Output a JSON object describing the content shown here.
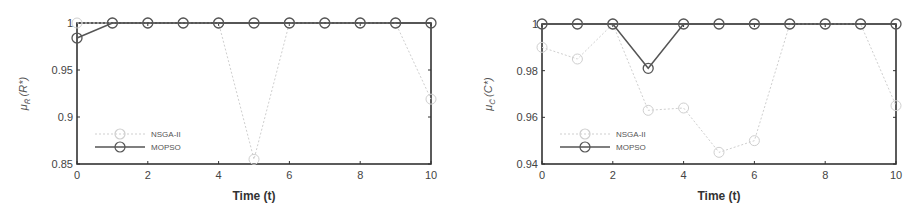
{
  "chart_data": [
    {
      "type": "line",
      "title": "",
      "xlabel": "Time (t)",
      "ylabel": "μ_R̃(R*)",
      "x": [
        0,
        1,
        2,
        3,
        4,
        5,
        6,
        7,
        8,
        9,
        10
      ],
      "xticks": [
        "0",
        "2",
        "4",
        "6",
        "8",
        "10"
      ],
      "yticks": [
        "0.85",
        "0.9",
        "0.95",
        "1"
      ],
      "xlim": [
        0,
        10
      ],
      "ylim": [
        0.85,
        1
      ],
      "grid": false,
      "legend_position": "lower left",
      "series": [
        {
          "name": "NSGA-II",
          "color": "#cfcfcf",
          "marker": "o",
          "values": [
            1,
            1,
            1,
            1,
            1,
            0.855,
            1,
            1,
            1,
            1,
            0.919
          ]
        },
        {
          "name": "MOPSO",
          "color": "#555555",
          "marker": "o",
          "values": [
            0.984,
            1,
            1,
            1,
            1,
            1,
            1,
            1,
            1,
            1,
            1
          ]
        }
      ]
    },
    {
      "type": "line",
      "title": "",
      "xlabel": "Time (t)",
      "ylabel": "μ_C̃(C*)",
      "x": [
        0,
        1,
        2,
        3,
        4,
        5,
        6,
        7,
        8,
        9,
        10
      ],
      "xticks": [
        "0",
        "2",
        "4",
        "6",
        "8",
        "10"
      ],
      "yticks": [
        "0.94",
        "0.96",
        "0.98",
        "1"
      ],
      "xlim": [
        0,
        10
      ],
      "ylim": [
        0.94,
        1
      ],
      "grid": false,
      "legend_position": "lower left",
      "series": [
        {
          "name": "NSGA-II",
          "color": "#cfcfcf",
          "marker": "o",
          "values": [
            0.99,
            0.985,
            1,
            0.963,
            0.964,
            0.945,
            0.95,
            1,
            1,
            1,
            0.965
          ]
        },
        {
          "name": "MOPSO",
          "color": "#555555",
          "marker": "o",
          "values": [
            1,
            1,
            1,
            0.981,
            1,
            1,
            1,
            1,
            1,
            1,
            1
          ]
        }
      ]
    }
  ],
  "charts": [
    {
      "xlabel": "Time (t)",
      "ylabel_main": "μ",
      "ylabel_sub": "R̃",
      "ylabel_arg": "(R*)",
      "legend": [
        "NSGA-II",
        "MOPSO"
      ]
    },
    {
      "xlabel": "Time (t)",
      "ylabel_main": "μ",
      "ylabel_sub": "C̃",
      "ylabel_arg": "(C*)",
      "legend": [
        "NSGA-II",
        "MOPSO"
      ]
    }
  ]
}
